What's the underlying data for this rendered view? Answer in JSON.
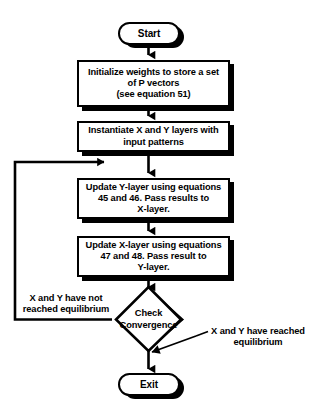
{
  "diagram": {
    "background_color": "#ffffff",
    "stroke_color": "#000000",
    "shadow_color": "#000000",
    "nodes": {
      "start": {
        "shape": "terminator",
        "label": "Start"
      },
      "init_weights": {
        "shape": "process",
        "lines": [
          "Initialize weights to store a set",
          "of P vectors",
          "(see equation 51)"
        ]
      },
      "instantiate_layers": {
        "shape": "process",
        "lines": [
          "Instantiate X and Y layers with",
          "input patterns"
        ]
      },
      "update_y_layer": {
        "shape": "process",
        "lines": [
          "Update Y-layer using equations",
          "45 and 46. Pass results to",
          "X-layer."
        ]
      },
      "update_x_layer": {
        "shape": "process",
        "lines": [
          "Update X-layer using equations",
          "47 and 48.  Pass result to",
          "Y-layer."
        ]
      },
      "check_convergence": {
        "shape": "decision",
        "lines": [
          "Check",
          "Convergence"
        ]
      },
      "exit": {
        "shape": "terminator",
        "label": "Exit"
      }
    },
    "edge_labels": {
      "no_branch": [
        "X and Y have not",
        "reached equilibrium"
      ],
      "yes_branch": [
        "X and Y have reached",
        "equilibrium"
      ]
    }
  }
}
